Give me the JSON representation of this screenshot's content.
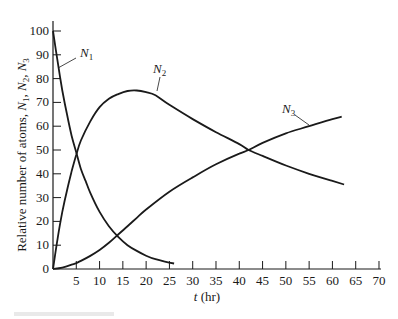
{
  "chart_data": {
    "type": "line",
    "title": "",
    "xlabel": "t (hr)",
    "xlabel_parts": {
      "var": "t",
      "unit": " (hr)"
    },
    "ylabel": "Relative number of atoms, N1, N2, N3",
    "ylabel_parts": {
      "prefix": "Relative number of atoms, ",
      "s1": "N",
      "s1sub": "1",
      "s2": "N",
      "s2sub": "2",
      "s3": "N",
      "s3sub": "3"
    },
    "xlim": [
      0,
      70
    ],
    "ylim": [
      0,
      100
    ],
    "xticks": [
      5,
      10,
      15,
      20,
      25,
      30,
      35,
      40,
      45,
      50,
      55,
      60,
      65,
      70
    ],
    "yticks": [
      0,
      10,
      20,
      30,
      40,
      50,
      60,
      70,
      80,
      90,
      100
    ],
    "grid": false,
    "legend": "inline labels with leader lines",
    "series": [
      {
        "name": "N1",
        "label_main": "N",
        "label_sub": "1",
        "x": [
          0,
          1,
          2,
          3,
          4,
          5,
          6,
          7,
          8,
          10,
          12,
          14,
          16,
          18,
          20,
          22,
          24,
          26
        ],
        "values": [
          100,
          87,
          75,
          65,
          56,
          49,
          42,
          37,
          32,
          24,
          18,
          13.5,
          10,
          7.6,
          5.6,
          4.1,
          3.1,
          2.3
        ]
      },
      {
        "name": "N2",
        "label_main": "N",
        "label_sub": "2",
        "x": [
          0,
          1,
          2,
          3,
          4,
          5,
          6,
          8,
          10,
          12,
          14,
          16,
          18,
          20,
          22,
          25,
          30,
          35,
          40,
          42,
          45,
          50,
          55,
          60,
          62.5
        ],
        "values": [
          0,
          13,
          24,
          33,
          41,
          48,
          54,
          62,
          68,
          71.5,
          73.5,
          74.8,
          75,
          74.3,
          73,
          69,
          63,
          57.5,
          52.5,
          50,
          47.5,
          43.5,
          40,
          37,
          35.5
        ]
      },
      {
        "name": "N3",
        "label_main": "N",
        "label_sub": "3",
        "x": [
          0,
          2,
          4,
          5,
          6,
          8,
          10,
          12,
          14,
          16,
          18,
          20,
          25,
          30,
          35,
          40,
          42,
          45,
          50,
          55,
          60,
          62
        ],
        "values": [
          0,
          0.6,
          1.8,
          2.5,
          3.4,
          5.5,
          8,
          11,
          14.5,
          18,
          21.5,
          25,
          32.5,
          38.5,
          44,
          48.5,
          50,
          53,
          57,
          60,
          63,
          64
        ]
      }
    ],
    "annotations": [
      {
        "series": "N1",
        "text_pos": [
          80,
          57
        ],
        "pointer": [
          [
            76,
            58
          ],
          [
            58,
            68
          ]
        ]
      },
      {
        "series": "N2",
        "text_pos": [
          153,
          73
        ],
        "pointer": [
          [
            160,
            77
          ],
          [
            157,
            91
          ]
        ]
      },
      {
        "series": "N3",
        "text_pos": [
          282,
          113
        ],
        "pointer": [
          [
            295,
            115
          ],
          [
            309,
            125
          ]
        ]
      }
    ]
  },
  "plot_area": {
    "x0": 53,
    "y0": 269,
    "x_per_unit": 4.657,
    "y_per_unit": 2.38
  },
  "colors": {
    "line": "#1a1a1a",
    "background": "#ffffff"
  }
}
